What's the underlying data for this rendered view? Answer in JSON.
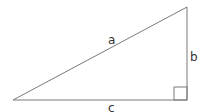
{
  "diagram": {
    "type": "right-triangle",
    "colors": {
      "stroke": "#7a7a7a",
      "label": "#333333",
      "background": "#ffffff"
    },
    "vertices": {
      "bottom_left": [
        13,
        100
      ],
      "bottom_right": [
        187,
        100
      ],
      "top_right": [
        187,
        7
      ]
    },
    "sides": [
      {
        "name": "a",
        "label": "a",
        "role": "hypotenuse"
      },
      {
        "name": "b",
        "label": "b",
        "role": "vertical leg"
      },
      {
        "name": "c",
        "label": "c",
        "role": "horizontal leg"
      }
    ],
    "right_angle_marker": true
  }
}
